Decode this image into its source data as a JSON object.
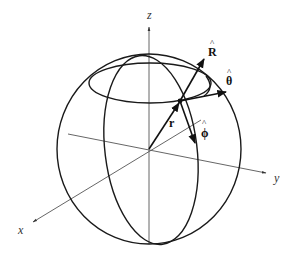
{
  "diagram": {
    "axes": {
      "x": {
        "label": "x"
      },
      "y": {
        "label": "y"
      },
      "z": {
        "label": "z"
      }
    },
    "vectors": {
      "r": {
        "label": "r"
      },
      "R_hat": {
        "label": "R",
        "hat": "^"
      },
      "theta_hat": {
        "label": "θ",
        "hat": "^"
      },
      "phi_hat": {
        "label": "ϕ",
        "hat": "^"
      }
    },
    "colors": {
      "stroke": "#1a1a1a",
      "axis": "#555555",
      "background": "#ffffff"
    }
  }
}
